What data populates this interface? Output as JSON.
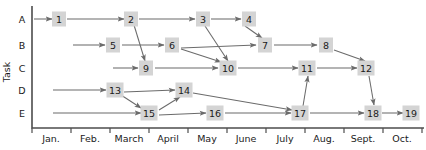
{
  "chart_data": {
    "type": "diagram",
    "title": "",
    "xlabel": "",
    "ylabel": "Task",
    "grid": false,
    "legend": "none",
    "x_tick_labels": [
      "Jan.",
      "Feb.",
      "March",
      "April",
      "May",
      "June",
      "July",
      "Aug.",
      "Sept.",
      "Oct."
    ],
    "y_tick_labels": [
      "A",
      "B",
      "C",
      "D",
      "E"
    ],
    "rows": [
      {
        "label": "A",
        "y": 19
      },
      {
        "label": "B",
        "y": 45
      },
      {
        "label": "C",
        "y": 68
      },
      {
        "label": "D",
        "y": 90
      },
      {
        "label": "E",
        "y": 113
      }
    ],
    "nodes": [
      {
        "id": "1",
        "label": "1",
        "row": "A",
        "x": 59,
        "y": 19
      },
      {
        "id": "2",
        "label": "2",
        "row": "A",
        "x": 131,
        "y": 19
      },
      {
        "id": "3",
        "label": "3",
        "row": "A",
        "x": 203,
        "y": 19
      },
      {
        "id": "4",
        "label": "4",
        "row": "A",
        "x": 249,
        "y": 19
      },
      {
        "id": "5",
        "label": "5",
        "row": "B",
        "x": 113,
        "y": 45
      },
      {
        "id": "6",
        "label": "6",
        "row": "B",
        "x": 172,
        "y": 45
      },
      {
        "id": "7",
        "label": "7",
        "row": "B",
        "x": 265,
        "y": 45
      },
      {
        "id": "8",
        "label": "8",
        "row": "B",
        "x": 326,
        "y": 45
      },
      {
        "id": "9",
        "label": "9",
        "row": "C",
        "x": 146,
        "y": 68
      },
      {
        "id": "10",
        "label": "10",
        "row": "C",
        "x": 228,
        "y": 68
      },
      {
        "id": "11",
        "label": "11",
        "row": "C",
        "x": 307,
        "y": 68
      },
      {
        "id": "12",
        "label": "12",
        "row": "C",
        "x": 366,
        "y": 68
      },
      {
        "id": "13",
        "label": "13",
        "row": "D",
        "x": 115,
        "y": 90
      },
      {
        "id": "14",
        "label": "14",
        "row": "D",
        "x": 184,
        "y": 90
      },
      {
        "id": "15",
        "label": "15",
        "row": "E",
        "x": 149,
        "y": 113
      },
      {
        "id": "16",
        "label": "16",
        "row": "E",
        "x": 215,
        "y": 113
      },
      {
        "id": "17",
        "label": "17",
        "row": "E",
        "x": 300,
        "y": 113
      },
      {
        "id": "18",
        "label": "18",
        "row": "E",
        "x": 373,
        "y": 113
      },
      {
        "id": "19",
        "label": "19",
        "row": "E",
        "x": 411,
        "y": 113
      }
    ],
    "edges": [
      {
        "from": "axis",
        "to": "1",
        "x1": 34,
        "y1": 19,
        "x2": 52,
        "y2": 19
      },
      {
        "from": "1",
        "to": "2",
        "x1": 67,
        "y1": 19,
        "x2": 124,
        "y2": 19
      },
      {
        "from": "2",
        "to": "3",
        "x1": 139,
        "y1": 19,
        "x2": 195,
        "y2": 19
      },
      {
        "from": "3",
        "to": "4",
        "x1": 211,
        "y1": 19,
        "x2": 241,
        "y2": 19
      },
      {
        "from": "axis",
        "to": "5",
        "x1": 73,
        "y1": 45,
        "x2": 105,
        "y2": 45
      },
      {
        "from": "5",
        "to": "6",
        "x1": 122,
        "y1": 45,
        "x2": 164,
        "y2": 45
      },
      {
        "from": "6",
        "to": "7",
        "x1": 181,
        "y1": 48,
        "x2": 256,
        "y2": 45
      },
      {
        "from": "7",
        "to": "8",
        "x1": 274,
        "y1": 45,
        "x2": 317,
        "y2": 45
      },
      {
        "from": "2",
        "to": "9",
        "x1": 134,
        "y1": 25,
        "x2": 145,
        "y2": 61
      },
      {
        "from": "axis",
        "to": "9",
        "x1": 113,
        "y1": 68,
        "x2": 138,
        "y2": 68
      },
      {
        "from": "9",
        "to": "10",
        "x1": 155,
        "y1": 68,
        "x2": 218,
        "y2": 68
      },
      {
        "from": "3",
        "to": "10",
        "x1": 205,
        "y1": 26,
        "x2": 228,
        "y2": 61
      },
      {
        "from": "6",
        "to": "10",
        "x1": 181,
        "y1": 49,
        "x2": 221,
        "y2": 62
      },
      {
        "from": "10",
        "to": "11",
        "x1": 238,
        "y1": 68,
        "x2": 298,
        "y2": 68
      },
      {
        "from": "11",
        "to": "12",
        "x1": 317,
        "y1": 68,
        "x2": 357,
        "y2": 68
      },
      {
        "from": "4",
        "to": "7",
        "x1": 245,
        "y1": 26,
        "x2": 262,
        "y2": 38
      },
      {
        "from": "8",
        "to": "12",
        "x1": 334,
        "y1": 50,
        "x2": 365,
        "y2": 61
      },
      {
        "from": "axis",
        "to": "13",
        "x1": 53,
        "y1": 90,
        "x2": 106,
        "y2": 90
      },
      {
        "from": "13",
        "to": "14",
        "x1": 124,
        "y1": 92,
        "x2": 175,
        "y2": 90
      },
      {
        "from": "13",
        "to": "15",
        "x1": 121,
        "y1": 95,
        "x2": 141,
        "y2": 108
      },
      {
        "from": "15",
        "to": "14",
        "x1": 159,
        "y1": 110,
        "x2": 180,
        "y2": 97
      },
      {
        "from": "14",
        "to": "17",
        "x1": 193,
        "y1": 93,
        "x2": 292,
        "y2": 110
      },
      {
        "from": "axis",
        "to": "15",
        "x1": 53,
        "y1": 113,
        "x2": 141,
        "y2": 113
      },
      {
        "from": "15",
        "to": "16",
        "x1": 159,
        "y1": 115,
        "x2": 206,
        "y2": 113
      },
      {
        "from": "16",
        "to": "17",
        "x1": 225,
        "y1": 113,
        "x2": 291,
        "y2": 113
      },
      {
        "from": "17",
        "to": "11",
        "x1": 303,
        "y1": 106,
        "x2": 308,
        "y2": 76
      },
      {
        "from": "17",
        "to": "18",
        "x1": 310,
        "y1": 113,
        "x2": 364,
        "y2": 113
      },
      {
        "from": "12",
        "to": "18",
        "x1": 369,
        "y1": 76,
        "x2": 374,
        "y2": 105
      },
      {
        "from": "18",
        "to": "19",
        "x1": 382,
        "y1": 113,
        "x2": 403,
        "y2": 113
      }
    ],
    "axis": {
      "origin_x": 32,
      "baseline_y": 128,
      "top_y": 6,
      "right_x": 424,
      "tick_xs": [
        32,
        71,
        110,
        149,
        188,
        227,
        266,
        305,
        344,
        383,
        422
      ],
      "month_label_xs": [
        51,
        90,
        129,
        168,
        207,
        246,
        285,
        324,
        363,
        402
      ],
      "month_label_y": 142
    },
    "colors": {
      "node_fill": "#d4d4d4",
      "line": "#6b6b6b",
      "axis": "#4d4d4d",
      "text": "#1a1a1a",
      "background": "#ffffff"
    }
  }
}
